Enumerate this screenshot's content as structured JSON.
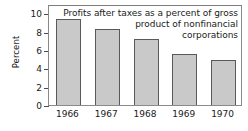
{
  "chart_data": {
    "type": "bar",
    "title_lines": [
      "Profits after taxes as a percent of gross",
      "product of nonfinancial",
      "corporations"
    ],
    "categories": [
      "1966",
      "1967",
      "1968",
      "1969",
      "1970"
    ],
    "values": [
      9.4,
      8.3,
      7.2,
      5.55,
      4.95
    ],
    "xlabel": "",
    "ylabel": "Percent",
    "ylim": [
      0,
      11
    ],
    "yticks": [
      0,
      2,
      4,
      6,
      8,
      10
    ],
    "ytick_labels": [
      "0",
      "2",
      "4",
      "6",
      "8",
      "10"
    ],
    "grid": false,
    "legend": false,
    "bar_color": "#c9c9c9",
    "bar_edge_color": "#595959",
    "frame_color": "#8a8a8a",
    "text_color": "#1a1a1a"
  }
}
